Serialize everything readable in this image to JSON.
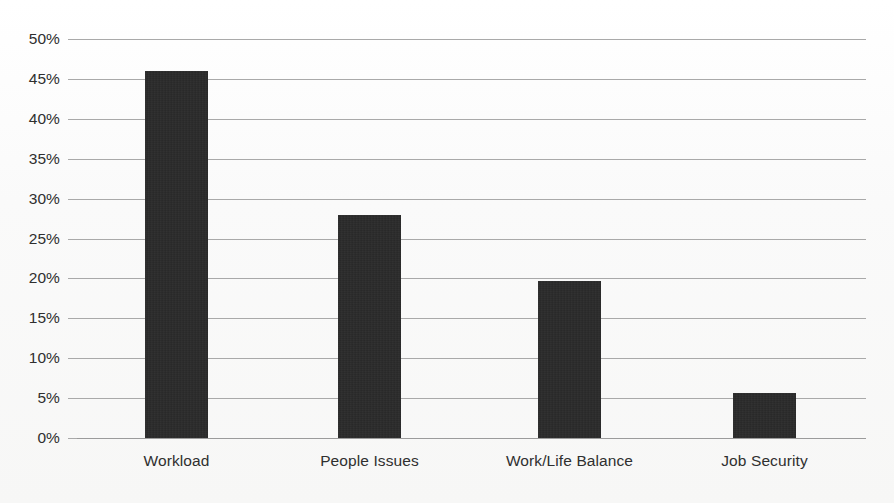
{
  "chart_data": {
    "type": "bar",
    "title": "",
    "subtitle": "",
    "xlabel": "",
    "ylabel": "",
    "categories": [
      "Workload",
      "People Issues",
      "Work/Life Balance",
      "Job Security"
    ],
    "values": [
      46,
      27.9,
      19.7,
      5.6
    ],
    "value_labels": [
      "46%",
      "27.9%",
      "19.7%",
      "5.6%"
    ],
    "ylim": [
      0,
      50
    ],
    "ytick_values": [
      0,
      5,
      10,
      15,
      20,
      25,
      30,
      35,
      40,
      45,
      50
    ],
    "ytick_labels": [
      "0%",
      "5%",
      "10%",
      "15%",
      "20%",
      "25%",
      "30%",
      "35%",
      "40%",
      "45%",
      "50%"
    ],
    "grid": true,
    "grid_axis": "y",
    "legend": false,
    "legend_position": "none",
    "series": [
      {
        "name": "Share of respondents",
        "values": [
          46,
          27.9,
          19.7,
          5.6
        ]
      }
    ],
    "colors": {
      "bar": "#262626",
      "gridline": "#a9a9a9",
      "background": "#fbfbfb",
      "text": "#2f2f2f"
    }
  }
}
